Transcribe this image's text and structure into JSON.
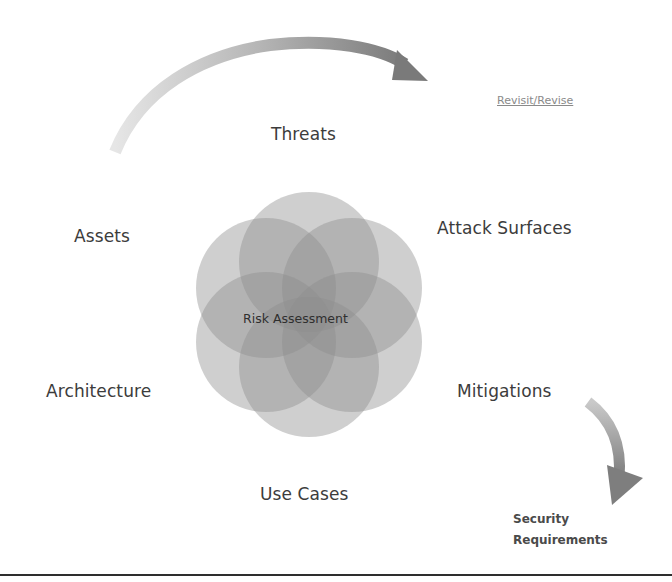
{
  "diagram": {
    "title": "Risk Assessment",
    "center_label": "Risk Assessment",
    "nodes": [
      {
        "id": "threats",
        "label": "Threats"
      },
      {
        "id": "attack-surfaces",
        "label": "Attack Surfaces"
      },
      {
        "id": "mitigations",
        "label": "Mitigations"
      },
      {
        "id": "use-cases",
        "label": "Use Cases"
      },
      {
        "id": "architecture",
        "label": "Architecture"
      },
      {
        "id": "assets",
        "label": "Assets"
      }
    ],
    "feedback_arrow": {
      "label": "Revisit/Revise"
    },
    "output_arrow": {
      "label_line1": "Security",
      "label_line2": "Requirements"
    },
    "colors": {
      "circle_fill": "#8c8c8c",
      "arrow_light": "#e0e0e0",
      "arrow_dark": "#7a7a7a",
      "text": "#3c3c3c",
      "rule": "#2e2e2e"
    }
  }
}
